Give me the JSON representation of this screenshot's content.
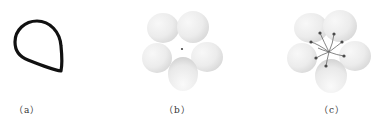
{
  "figure": {
    "panels": [
      {
        "id": "a",
        "label": "（a）",
        "content": "teardrop-outline",
        "stroke_color": "#111111"
      },
      {
        "id": "b",
        "label": "（b）",
        "content": "five-petal-flower"
      },
      {
        "id": "c",
        "label": "（c）",
        "content": "five-petal-flower-with-stamens",
        "stamen_count": 7,
        "stamen_color": "#555555"
      }
    ],
    "colors": {
      "outline": "#111111",
      "petal_light": "#f6f6f6",
      "petal_dark": "#d4d4d4",
      "stamen": "#555555"
    }
  }
}
